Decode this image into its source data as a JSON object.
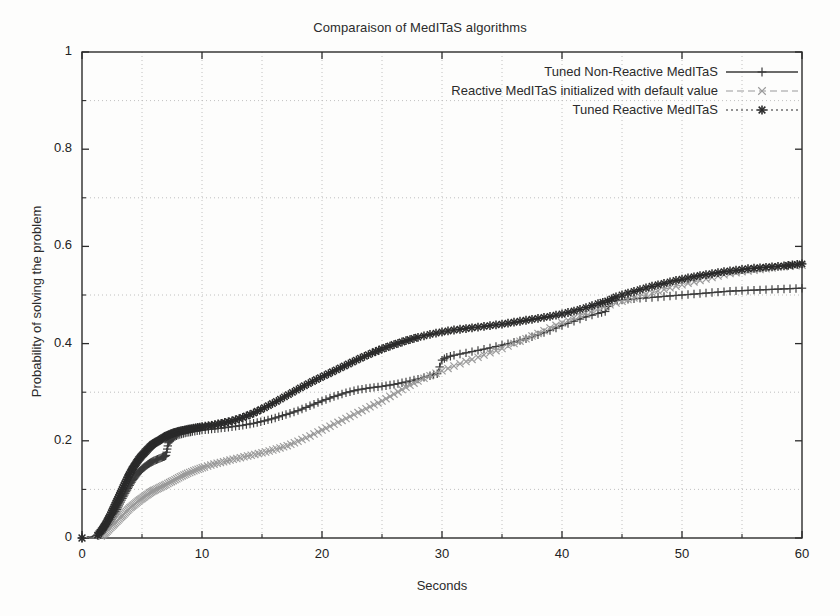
{
  "figure": {
    "width": 840,
    "height": 616,
    "background": "#fdfdfc",
    "bottom_caption": ""
  },
  "plot_box": {
    "left": 82,
    "top": 52,
    "right": 802,
    "bottom": 538
  },
  "chart_data": {
    "type": "line",
    "title": "Comparaison of MedITaS algorithms",
    "xlabel": "Seconds",
    "ylabel": "Probability of solving the problem",
    "xlim": [
      0,
      60
    ],
    "ylim": [
      0,
      1
    ],
    "xticks": [
      0,
      10,
      20,
      30,
      40,
      50,
      60
    ],
    "yticks": [
      0,
      0.2,
      0.4,
      0.6,
      0.8,
      1
    ],
    "x_minor_gridlines": [
      5,
      15,
      25,
      35,
      45,
      55
    ],
    "y_minor_gridlines": [
      0.1,
      0.3,
      0.5,
      0.7,
      0.9
    ],
    "grid": true,
    "grid_style": "dotted",
    "grid_color": "#b9b9b9",
    "legend_position": "top-right-inside",
    "series": [
      {
        "name": "Tuned Non-Reactive MedITaS",
        "marker": "plus",
        "linestyle": "solid",
        "color": "#3a3a3a",
        "x": [
          0,
          1.4,
          1.8,
          2.1,
          2.4,
          2.7,
          3.0,
          3.3,
          3.6,
          3.9,
          4.2,
          4.5,
          4.8,
          5.1,
          5.4,
          5.7,
          6.0,
          6.4,
          6.8,
          7.0,
          7.2,
          7.5,
          8.0,
          8.6,
          9.2,
          10.0,
          10.8,
          11.6,
          12.5,
          13.4,
          14.3,
          15.2,
          16.1,
          17.0,
          18.0,
          19.0,
          20.0,
          21.0,
          22.0,
          23.0,
          24.0,
          25.0,
          26.0,
          27.0,
          28.0,
          29.0,
          29.6,
          30.0,
          30.4,
          31.0,
          32.0,
          33.0,
          34.0,
          35.0,
          36.0,
          37.0,
          38.0,
          39.0,
          40.0,
          41.0,
          42.0,
          43.0,
          43.6,
          44.2,
          45.0,
          46.0,
          47.0,
          48.0,
          49.0,
          50.0,
          51.0,
          52.0,
          53.0,
          54.0,
          55.0,
          56.0,
          57.0,
          58.0,
          59.0,
          60.0
        ],
        "y": [
          0,
          0.005,
          0.015,
          0.025,
          0.035,
          0.048,
          0.062,
          0.078,
          0.092,
          0.105,
          0.118,
          0.128,
          0.137,
          0.144,
          0.15,
          0.155,
          0.159,
          0.163,
          0.167,
          0.17,
          0.196,
          0.205,
          0.212,
          0.216,
          0.219,
          0.222,
          0.224,
          0.226,
          0.229,
          0.232,
          0.236,
          0.241,
          0.247,
          0.254,
          0.262,
          0.272,
          0.282,
          0.291,
          0.299,
          0.305,
          0.309,
          0.312,
          0.316,
          0.321,
          0.327,
          0.334,
          0.338,
          0.366,
          0.372,
          0.376,
          0.381,
          0.386,
          0.391,
          0.397,
          0.403,
          0.41,
          0.418,
          0.427,
          0.437,
          0.446,
          0.455,
          0.462,
          0.466,
          0.487,
          0.49,
          0.492,
          0.494,
          0.496,
          0.498,
          0.5,
          0.502,
          0.504,
          0.506,
          0.508,
          0.509,
          0.51,
          0.511,
          0.512,
          0.513,
          0.514
        ]
      },
      {
        "name": "Reactive MedITaS initialized with default value",
        "marker": "x",
        "linestyle": "dashed",
        "color": "#9a9a9a",
        "x": [
          0,
          1.6,
          2.0,
          2.4,
          2.8,
          3.2,
          3.6,
          4.0,
          4.4,
          4.8,
          5.2,
          5.6,
          6.0,
          6.5,
          7.0,
          7.6,
          8.2,
          8.8,
          9.5,
          10.2,
          11.0,
          11.8,
          12.6,
          13.5,
          14.4,
          15.3,
          16.2,
          17.1,
          18.0,
          19.0,
          20.0,
          21.0,
          22.0,
          23.0,
          24.0,
          25.0,
          26.0,
          27.0,
          28.0,
          29.0,
          30.0,
          31.0,
          32.0,
          33.0,
          34.0,
          35.0,
          36.0,
          37.0,
          38.0,
          39.0,
          40.0,
          41.0,
          42.0,
          43.0,
          44.0,
          45.0,
          46.0,
          47.0,
          48.0,
          49.0,
          50.0,
          51.0,
          52.0,
          53.0,
          54.0,
          55.0,
          56.0,
          57.0,
          58.0,
          59.0,
          60.0
        ],
        "y": [
          0,
          0.004,
          0.012,
          0.022,
          0.032,
          0.042,
          0.052,
          0.062,
          0.07,
          0.078,
          0.085,
          0.092,
          0.098,
          0.104,
          0.11,
          0.118,
          0.126,
          0.133,
          0.14,
          0.146,
          0.152,
          0.157,
          0.162,
          0.167,
          0.172,
          0.177,
          0.183,
          0.19,
          0.199,
          0.21,
          0.222,
          0.234,
          0.246,
          0.258,
          0.27,
          0.282,
          0.296,
          0.31,
          0.323,
          0.334,
          0.344,
          0.354,
          0.363,
          0.372,
          0.381,
          0.39,
          0.4,
          0.41,
          0.421,
          0.432,
          0.443,
          0.453,
          0.463,
          0.472,
          0.48,
          0.487,
          0.494,
          0.501,
          0.508,
          0.515,
          0.521,
          0.527,
          0.533,
          0.539,
          0.544,
          0.548,
          0.551,
          0.554,
          0.557,
          0.559,
          0.561
        ]
      },
      {
        "name": "Tuned Reactive MedITaS",
        "marker": "asterisk",
        "linestyle": "dotted",
        "color": "#2a2a2a",
        "x": [
          0,
          1.3,
          1.7,
          2.0,
          2.3,
          2.6,
          2.9,
          3.2,
          3.5,
          3.8,
          4.1,
          4.4,
          4.7,
          5.0,
          5.3,
          5.6,
          5.9,
          6.3,
          6.7,
          7.1,
          7.6,
          8.1,
          8.7,
          9.3,
          10.0,
          10.8,
          11.6,
          12.5,
          13.4,
          14.3,
          15.2,
          16.2,
          17.2,
          18.2,
          19.2,
          20.2,
          21.2,
          22.2,
          23.2,
          24.2,
          25.0,
          26.0,
          27.0,
          28.0,
          29.0,
          30.0,
          31.0,
          32.0,
          33.0,
          34.0,
          35.0,
          36.0,
          37.0,
          38.0,
          39.0,
          40.0,
          41.0,
          42.0,
          43.0,
          43.8,
          44.5,
          45.5,
          46.5,
          47.5,
          48.5,
          49.5,
          50.5,
          51.5,
          52.5,
          53.5,
          54.5,
          55.5,
          56.5,
          57.5,
          58.5,
          59.2,
          60.0
        ],
        "y": [
          0,
          0.006,
          0.018,
          0.03,
          0.044,
          0.06,
          0.076,
          0.092,
          0.108,
          0.124,
          0.138,
          0.15,
          0.161,
          0.17,
          0.178,
          0.186,
          0.193,
          0.199,
          0.205,
          0.211,
          0.216,
          0.22,
          0.223,
          0.226,
          0.229,
          0.232,
          0.236,
          0.241,
          0.248,
          0.257,
          0.268,
          0.281,
          0.295,
          0.309,
          0.322,
          0.334,
          0.346,
          0.358,
          0.37,
          0.381,
          0.389,
          0.398,
          0.406,
          0.413,
          0.419,
          0.424,
          0.428,
          0.431,
          0.434,
          0.437,
          0.44,
          0.444,
          0.448,
          0.452,
          0.456,
          0.461,
          0.467,
          0.474,
          0.482,
          0.488,
          0.496,
          0.504,
          0.511,
          0.518,
          0.524,
          0.53,
          0.535,
          0.54,
          0.544,
          0.548,
          0.551,
          0.554,
          0.556,
          0.558,
          0.56,
          0.562,
          0.564
        ]
      }
    ]
  },
  "axis": {
    "x_tick_labels": [
      "0",
      "10",
      "20",
      "30",
      "40",
      "50",
      "60"
    ],
    "y_tick_labels": [
      "0",
      "0.2",
      "0.4",
      "0.6",
      "0.8",
      "1"
    ]
  }
}
